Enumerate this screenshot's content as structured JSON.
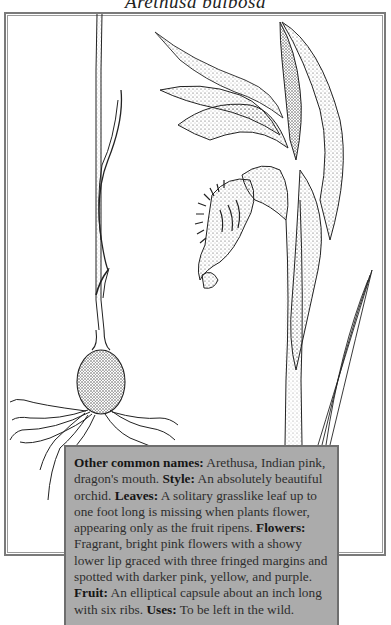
{
  "title": "Arethusa bulbosa",
  "illustration": {
    "subject": "Arethusa bulbosa orchid",
    "parts": [
      "bulb-with-roots",
      "grasslike-leaf-stem",
      "flower-with-fringed-lip",
      "sepals-and-petals",
      "basal-leaf"
    ]
  },
  "description": {
    "entries": [
      {
        "label": "Other common names:",
        "text": " Arethusa, Indian pink, dragon's mouth. "
      },
      {
        "label": "Style:",
        "text": " An absolutely beautiful orchid. "
      },
      {
        "label": "Leaves:",
        "text": " A solitary grasslike leaf up to one foot long is missing when plants flower, appearing only as the fruit ripens. "
      },
      {
        "label": "Flowers:",
        "text": " Fragrant, bright pink flowers with a showy lower lip graced with three fringed margins and spotted with darker pink, yellow, and purple. "
      },
      {
        "label": "Fruit:",
        "text": " An elliptical capsule about an inch long with six ribs. "
      },
      {
        "label": "Uses:",
        "text": " To be left in the wild."
      }
    ]
  },
  "colors": {
    "textbox_bg": "#ababab",
    "frame": "#7a7a7a",
    "ink": "#1e1e1e"
  }
}
